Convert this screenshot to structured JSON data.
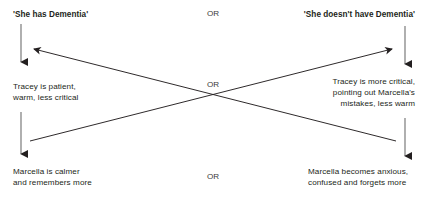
{
  "diagram": {
    "type": "crossing-outcomes-2x2",
    "line_color": "#231f20",
    "text_color": "#231f20",
    "background": "#ffffff",
    "headings": {
      "left": "'She has Dementia'",
      "right": "'She doesn't have Dementia'"
    },
    "middle_row": {
      "left": "Tracey is patient,\nwarm, less critical",
      "right": "Tracey is more critical,\npointing out Marcella's\nmistakes, less warm"
    },
    "bottom_row": {
      "left": "Marcella is calmer\nand remembers more",
      "right": "Marcella becomes anxious,\nconfused and forgets more"
    },
    "or_labels": {
      "top": "OR",
      "middle": "OR",
      "bottom": "OR"
    },
    "connectors": [
      {
        "name": "left-belief-to-left-tracey",
        "kind": "vertical-arrow",
        "from": [
          21,
          24
        ],
        "to": [
          21,
          66
        ],
        "arrowhead": "end"
      },
      {
        "name": "right-belief-to-right-tracey",
        "kind": "vertical-arrow",
        "from": [
          405,
          26
        ],
        "to": [
          405,
          68
        ],
        "arrowhead": "end"
      },
      {
        "name": "left-tracey-to-left-marcella",
        "kind": "vertical-arrow",
        "from": [
          21,
          112
        ],
        "to": [
          21,
          158
        ],
        "arrowhead": "end"
      },
      {
        "name": "right-tracey-to-right-marcella",
        "kind": "vertical-arrow",
        "from": [
          405,
          118
        ],
        "to": [
          405,
          160
        ],
        "arrowhead": "end"
      },
      {
        "name": "diagonal-bottomleft-to-topright",
        "kind": "diagonal-arrow",
        "from": [
          30,
          141
        ],
        "to": [
          396,
          48
        ],
        "arrowhead": "end"
      },
      {
        "name": "diagonal-bottomright-to-topleft",
        "kind": "diagonal-arrow",
        "from": [
          396,
          141
        ],
        "to": [
          30,
          48
        ],
        "arrowhead": "end"
      }
    ]
  }
}
